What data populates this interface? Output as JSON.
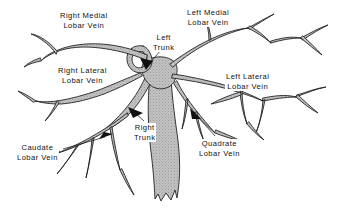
{
  "figure": {
    "type": "anatomical-diagram",
    "background_color": "#ffffff",
    "vessel_fill_color": "#b9b9b9",
    "vessel_outline_color": "#1a1a1a",
    "text_color": "#111111"
  },
  "labels": [
    {
      "id": "right-medial",
      "line1": "Right Medial",
      "line2": "Lobar Vein",
      "position": "top-left",
      "leader": "none"
    },
    {
      "id": "left-medial",
      "line1": "Left Medial",
      "line2": "Lobar Vein",
      "position": "top-right",
      "leader": "none"
    },
    {
      "id": "left-trunk",
      "line1": "Left",
      "line2": "Trunk",
      "position": "top-center",
      "leader": "arrow-down-left"
    },
    {
      "id": "right-lateral",
      "line1": "Right Lateral",
      "line2": "Lobar Vein",
      "position": "middle-left",
      "leader": "none"
    },
    {
      "id": "left-lateral",
      "line1": "Left Lateral",
      "line2": "Lobar Vein",
      "position": "middle-right",
      "leader": "none"
    },
    {
      "id": "right-trunk",
      "line1": "Right",
      "line2": "Trunk",
      "position": "center",
      "leader": "arrow-up-left"
    },
    {
      "id": "caudate",
      "line1": "Caudate",
      "line2": "Lobar Vein",
      "position": "bottom-left",
      "leader": "arrow-up-right"
    },
    {
      "id": "quadrate",
      "line1": "Quadrate",
      "line2": "Lobar Vein",
      "position": "bottom-right",
      "leader": "arrow-up-left"
    }
  ]
}
